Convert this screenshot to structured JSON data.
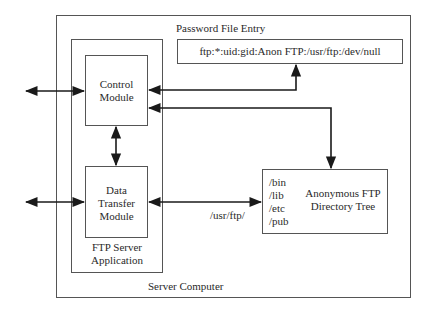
{
  "diagram": {
    "server_computer": {
      "label": "Server Computer"
    },
    "ftp_server_application": {
      "label_line1": "FTP Server",
      "label_line2": "Application"
    },
    "control_module": {
      "label_line1": "Control",
      "label_line2": "Module"
    },
    "data_transfer_module": {
      "label_line1": "Data",
      "label_line2": "Transfer",
      "label_line3": "Module"
    },
    "password_file_entry": {
      "title": "Password File Entry",
      "value": "ftp:*:uid:gid:Anon FTP:/usr/ftp:/dev/null"
    },
    "anonymous_ftp_tree": {
      "title_line1": "Anonymous FTP",
      "title_line2": "Directory Tree",
      "dirs": [
        "/bin",
        "/lib",
        "/etc",
        "/pub"
      ]
    },
    "path_label": "/usr/ftp/",
    "colors": {
      "line": "#1a1a1a",
      "box_border": "#555555"
    }
  }
}
